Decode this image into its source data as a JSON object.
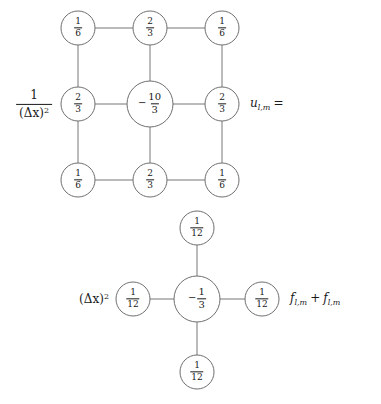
{
  "figure": {
    "background_color": "#ffffff",
    "line_color": "#767676",
    "text_color": "#1a1a1a"
  },
  "stencils": [
    {
      "id": "laplacian-stencil",
      "name": "nine-point-laplacian",
      "prefactor": {
        "numerator": "1",
        "denominator_base": "(Δx)",
        "denominator_exponent": "2"
      },
      "suffix": {
        "symbol": "u",
        "subscript": "l,m",
        "operator": "="
      },
      "nodes": [
        {
          "id": "tl",
          "position": "top-left",
          "cx": 78,
          "cy": 28,
          "r": 17,
          "sign": "",
          "numerator": "1",
          "denominator": "6",
          "value": "1/6"
        },
        {
          "id": "tc",
          "position": "top-center",
          "cx": 150,
          "cy": 28,
          "r": 17,
          "sign": "",
          "numerator": "2",
          "denominator": "3",
          "value": "2/3"
        },
        {
          "id": "tr",
          "position": "top-right",
          "cx": 222,
          "cy": 28,
          "r": 17,
          "sign": "",
          "numerator": "1",
          "denominator": "6",
          "value": "1/6"
        },
        {
          "id": "ml",
          "position": "middle-left",
          "cx": 78,
          "cy": 104,
          "r": 17,
          "sign": "",
          "numerator": "2",
          "denominator": "3",
          "value": "2/3"
        },
        {
          "id": "mc",
          "position": "center",
          "cx": 150,
          "cy": 104,
          "r": 23,
          "sign": "−",
          "numerator": "10",
          "denominator": "3",
          "value": "-10/3"
        },
        {
          "id": "mr",
          "position": "middle-right",
          "cx": 222,
          "cy": 104,
          "r": 17,
          "sign": "",
          "numerator": "2",
          "denominator": "3",
          "value": "2/3"
        },
        {
          "id": "bl",
          "position": "bottom-left",
          "cx": 78,
          "cy": 180,
          "r": 17,
          "sign": "",
          "numerator": "1",
          "denominator": "6",
          "value": "1/6"
        },
        {
          "id": "bc",
          "position": "bottom-center",
          "cx": 150,
          "cy": 180,
          "r": 17,
          "sign": "",
          "numerator": "2",
          "denominator": "3",
          "value": "2/3"
        },
        {
          "id": "br",
          "position": "bottom-right",
          "cx": 222,
          "cy": 180,
          "r": 17,
          "sign": "",
          "numerator": "1",
          "denominator": "6",
          "value": "1/6"
        }
      ],
      "edges": [
        {
          "from": "tl",
          "to": "tc"
        },
        {
          "from": "tc",
          "to": "tr"
        },
        {
          "from": "ml",
          "to": "mc"
        },
        {
          "from": "mc",
          "to": "mr"
        },
        {
          "from": "bl",
          "to": "bc"
        },
        {
          "from": "bc",
          "to": "br"
        },
        {
          "from": "tl",
          "to": "ml"
        },
        {
          "from": "ml",
          "to": "bl"
        },
        {
          "from": "tc",
          "to": "mc"
        },
        {
          "from": "mc",
          "to": "bc"
        },
        {
          "from": "tr",
          "to": "mr"
        },
        {
          "from": "mr",
          "to": "br"
        }
      ]
    },
    {
      "id": "source-stencil",
      "name": "five-point-source",
      "prefactor": {
        "base": "(Δx)",
        "exponent": "2"
      },
      "suffix": {
        "term1_symbol": "f",
        "term1_subscript": "l,m",
        "operator": "+",
        "term2_symbol": "f",
        "term2_subscript": "l,m"
      },
      "nodes": [
        {
          "id": "st",
          "position": "top",
          "cx": 197,
          "cy": 228,
          "r": 17,
          "sign": "",
          "numerator": "1",
          "denominator": "12",
          "value": "1/12"
        },
        {
          "id": "sl",
          "position": "left",
          "cx": 133,
          "cy": 299,
          "r": 17,
          "sign": "",
          "numerator": "1",
          "denominator": "12",
          "value": "1/12"
        },
        {
          "id": "sc",
          "position": "center",
          "cx": 197,
          "cy": 299,
          "r": 23,
          "sign": "−",
          "numerator": "1",
          "denominator": "3",
          "value": "-1/3"
        },
        {
          "id": "sr",
          "position": "right",
          "cx": 262,
          "cy": 299,
          "r": 17,
          "sign": "",
          "numerator": "1",
          "denominator": "12",
          "value": "1/12"
        },
        {
          "id": "sb",
          "position": "bottom",
          "cx": 197,
          "cy": 372,
          "r": 17,
          "sign": "",
          "numerator": "1",
          "denominator": "12",
          "value": "1/12"
        }
      ],
      "edges": [
        {
          "from": "st",
          "to": "sc"
        },
        {
          "from": "sl",
          "to": "sc"
        },
        {
          "from": "sc",
          "to": "sr"
        },
        {
          "from": "sc",
          "to": "sb"
        }
      ]
    }
  ],
  "labels": {
    "laplacian_prefactor_num": "1",
    "laplacian_prefactor_den_base": "(Δx)",
    "laplacian_prefactor_den_exp": "2",
    "laplacian_suffix_symbol": "u",
    "laplacian_suffix_sub": "l,m",
    "laplacian_suffix_eq": "=",
    "source_prefactor_base": "(Δx)",
    "source_prefactor_exp": "2",
    "source_suffix_f1": "f",
    "source_suffix_sub1": "l,m",
    "source_suffix_plus": "+",
    "source_suffix_f2": "f",
    "source_suffix_sub2": "l,m"
  }
}
